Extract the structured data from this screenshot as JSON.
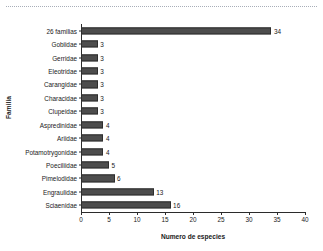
{
  "figure": {
    "background_color": "#ffffff",
    "bar_color": "#4d4d4d",
    "bar_edge_color": "#2e2e2e",
    "axis_color": "#2b2b2b",
    "text_color": "#1a1a1a"
  },
  "decoration": {
    "scan_rule_name": "dotted-separator-line"
  },
  "chart_data": {
    "type": "bar",
    "orientation": "horizontal",
    "title": "",
    "xlabel": "Numero de especies",
    "ylabel": "Familia",
    "xlim": [
      0,
      40
    ],
    "xticks": [
      0,
      5,
      10,
      15,
      20,
      25,
      30,
      35,
      40
    ],
    "xtick_labels": [
      "0",
      "5",
      "10",
      "15",
      "20",
      "25",
      "30",
      "35",
      "40"
    ],
    "grid": false,
    "legend": false,
    "show_value_labels": true,
    "categories": [
      "26 familias",
      "Gobiidae",
      "Gerridae",
      "Eleotridae",
      "Carangidae",
      "Characidae",
      "Clupeidae",
      "Aspredinidae",
      "Ariidae",
      "Potamotrygonidae",
      "Poeciliidae",
      "Pimelodidae",
      "Engraulidae",
      "Sciaenidae"
    ],
    "values": [
      34,
      3,
      3,
      3,
      3,
      3,
      3,
      4,
      4,
      4,
      5,
      6,
      13,
      16
    ],
    "value_labels": [
      "34",
      "3",
      "3",
      "3",
      "3",
      "3",
      "3",
      "4",
      "4",
      "4",
      "5",
      "6",
      "13",
      "16"
    ]
  }
}
